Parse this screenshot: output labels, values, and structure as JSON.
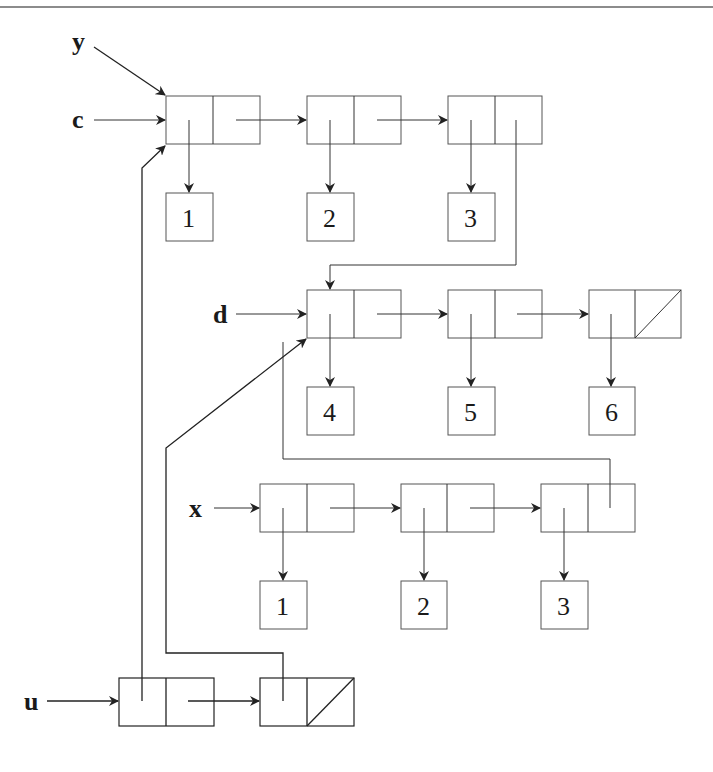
{
  "diagram": {
    "variables": {
      "y": "y",
      "c": "c",
      "d": "d",
      "x": "x",
      "u": "u"
    },
    "list_c": {
      "values": [
        "1",
        "2",
        "3"
      ]
    },
    "list_d": {
      "values": [
        "4",
        "5",
        "6"
      ]
    },
    "list_x": {
      "values": [
        "1",
        "2",
        "3"
      ]
    },
    "list_u": {
      "cells": 2
    },
    "colors": {
      "line": "#333333",
      "box": "#555555",
      "background": "#ffffff"
    }
  }
}
